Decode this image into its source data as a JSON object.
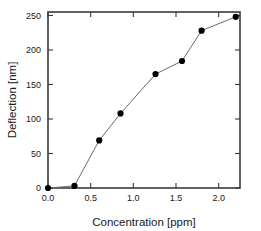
{
  "chart_data": {
    "type": "line",
    "title": "",
    "xlabel": "Concentration [ppm]",
    "ylabel": "Deflection [nm]",
    "x": [
      0.0,
      0.31,
      0.6,
      0.85,
      1.26,
      1.57,
      1.8,
      2.2
    ],
    "values": [
      0,
      3,
      69,
      108,
      165,
      184,
      228,
      248
    ],
    "series": [
      {
        "name": "Deflection",
        "x": [
          0.0,
          0.31,
          0.6,
          0.85,
          1.26,
          1.57,
          1.8,
          2.2
        ],
        "values": [
          0,
          3,
          69,
          108,
          165,
          184,
          228,
          248
        ]
      }
    ],
    "xlim": [
      0.0,
      2.25
    ],
    "ylim": [
      0,
      255
    ],
    "xticks": [
      0.0,
      0.5,
      1.0,
      1.5,
      2.0
    ],
    "xtick_labels": [
      "0.0",
      "0.5",
      "1.0",
      "1.5",
      "2.0"
    ],
    "yticks": [
      0,
      50,
      100,
      150,
      200,
      250
    ],
    "ytick_labels": [
      "0",
      "50",
      "100",
      "150",
      "200",
      "250"
    ],
    "grid": false,
    "legend": null,
    "marker": "filled-circle",
    "line_color": "#6b6b6b",
    "marker_color": "#000000",
    "axis_color": "#3a3a3a",
    "background": "#ffffff"
  }
}
